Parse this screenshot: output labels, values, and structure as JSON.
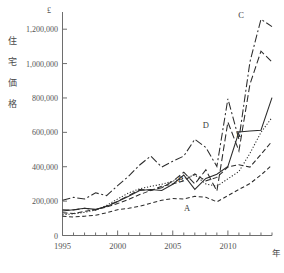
{
  "chart_data": {
    "type": "line",
    "title": "",
    "subtitle": "",
    "xlabel": "年",
    "ylabel": "住宅価格",
    "unit_label": "£",
    "x": [
      1995,
      1996,
      1997,
      1998,
      1999,
      2000,
      2001,
      2002,
      2003,
      2004,
      2005,
      2006,
      2007,
      2008,
      2009,
      2010,
      2011,
      2012,
      2013,
      2014
    ],
    "xlim": [
      1995,
      2014
    ],
    "ylim": [
      0,
      1300000
    ],
    "yticks": [
      0,
      200000,
      400000,
      600000,
      800000,
      1000000,
      1200000
    ],
    "ytick_labels": [
      "0",
      "200,000",
      "400,000",
      "600,000",
      "800,000",
      "1,000,000",
      "1,200,000"
    ],
    "xticks": [
      1995,
      1996,
      1997,
      1998,
      1999,
      2000,
      2001,
      2002,
      2003,
      2004,
      2005,
      2006,
      2007,
      2008,
      2009,
      2010,
      2011,
      2012,
      2013,
      2014
    ],
    "xtick_labels_shown": [
      "1995",
      "2000",
      "2005",
      "2010"
    ],
    "xtick_label_years": [
      1995,
      2000,
      2005,
      2010
    ],
    "grid": false,
    "legend": "inline-series-labels",
    "series": [
      {
        "name": "A",
        "label": "A",
        "linestyle": "dashed",
        "label_year": 2006.3,
        "label_value": 143000,
        "values": [
          112000,
          108000,
          112000,
          118000,
          132000,
          150000,
          158000,
          170000,
          188000,
          205000,
          215000,
          212000,
          228000,
          222000,
          196000,
          232000,
          268000,
          302000,
          352000,
          410000
        ]
      },
      {
        "name": "B",
        "label": "B",
        "linestyle": "dotted",
        "label_year": 2005.7,
        "label_value": 312000,
        "values": [
          120000,
          126000,
          135000,
          148000,
          175000,
          212000,
          248000,
          272000,
          286000,
          298000,
          316000,
          332000,
          352000,
          300000,
          286000,
          330000,
          372000,
          478000,
          600000,
          686000
        ]
      },
      {
        "name": "C",
        "label": "C",
        "linestyle": "dashdot-long",
        "label_year": 2011.2,
        "label_value": 1268000,
        "values": [
          205000,
          222000,
          212000,
          248000,
          232000,
          290000,
          345000,
          410000,
          462000,
          398000,
          432000,
          462000,
          560000,
          512000,
          402000,
          795000,
          560000,
          1010000,
          1258000,
          1215000
        ]
      },
      {
        "name": "D",
        "label": "D",
        "linestyle": "dashed-long",
        "label_year": 2008.0,
        "label_value": 625000,
        "values": [
          150000,
          148000,
          158000,
          148000,
          172000,
          198000,
          232000,
          268000,
          262000,
          278000,
          316000,
          368000,
          300000,
          382000,
          258000,
          660000,
          492000,
          880000,
          1072000,
          1010000
        ]
      },
      {
        "name": "E",
        "label": "E",
        "linestyle": "solid",
        "label_year": 2011.0,
        "label_value": 572000,
        "values": [
          142000,
          150000,
          158000,
          152000,
          168000,
          198000,
          228000,
          262000,
          268000,
          262000,
          298000,
          352000,
          268000,
          332000,
          356000,
          402000,
          602000,
          608000,
          612000,
          802000
        ]
      },
      {
        "name": "F",
        "label": "",
        "linestyle": "dashed-med",
        "label_year": null,
        "label_value": null,
        "values": [
          132000,
          128000,
          140000,
          150000,
          166000,
          186000,
          210000,
          238000,
          262000,
          286000,
          300000,
          318000,
          358000,
          318000,
          338000,
          398000,
          412000,
          398000,
          472000,
          548000
        ]
      }
    ]
  }
}
